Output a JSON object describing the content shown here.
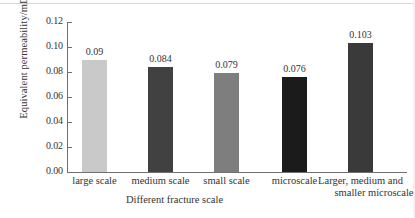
{
  "chart_data": {
    "type": "bar",
    "title": "",
    "xlabel": "Different fracture scale",
    "ylabel": "Equivalent permeability/mD",
    "categories": [
      "large scale",
      "medium scale",
      "small scale",
      "microscale",
      "Larger, medium and smaller microscale"
    ],
    "category_lines": [
      [
        "large scale"
      ],
      [
        "medium scale"
      ],
      [
        "small scale"
      ],
      [
        "microscale"
      ],
      [
        "Larger, medium and",
        "smaller microscale"
      ]
    ],
    "values": [
      0.09,
      0.084,
      0.079,
      0.076,
      0.103
    ],
    "value_labels": [
      "0.09",
      "0.084",
      "0.079",
      "0.076",
      "0.103"
    ],
    "bar_colors": [
      "#c9c9c9",
      "#414141",
      "#7e7e7e",
      "#1b1b1b",
      "#3a3a3a"
    ],
    "ylim": [
      0.0,
      0.12
    ],
    "ytick_values": [
      0.0,
      0.02,
      0.04,
      0.06,
      0.08,
      0.1,
      0.12
    ],
    "ytick_labels": [
      "0.00",
      "0.02",
      "0.04",
      "0.06",
      "0.08",
      "0.10",
      "0.12"
    ],
    "grid": false,
    "legend": null,
    "axis_color": "#6f6f6f"
  }
}
